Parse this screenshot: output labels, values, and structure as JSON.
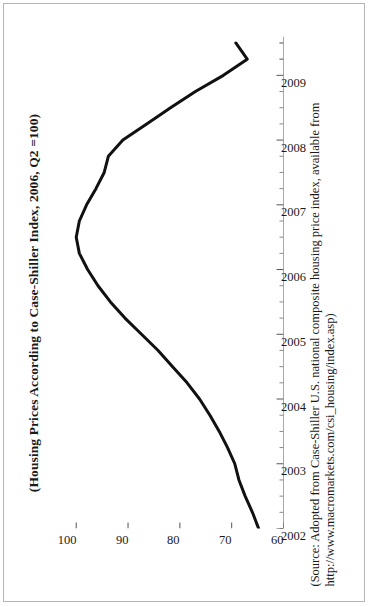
{
  "figure": {
    "title": "(Housing Prices According to Case-Shiller Index, 2006, Q2 =100)",
    "source_line_1": "(Source: Adopted from Case-Shiller U.S. national composite housing price index, available from",
    "source_line_2": "http://www.macromarkets.com/csi_housing/index.asp)"
  },
  "chart_data": {
    "type": "line",
    "title": "(Housing Prices According to Case-Shiller Index, 2006, Q2 =100)",
    "xlabel": "",
    "ylabel": "",
    "xlim": [
      2002,
      2009.6
    ],
    "ylim": [
      60,
      104
    ],
    "grid": false,
    "legend": null,
    "orientation": "page-rotated-90ccw",
    "xticks": [
      "2002",
      "2003",
      "2004",
      "2005",
      "2006",
      "2007",
      "2008",
      "2009"
    ],
    "xtick_values": [
      2002,
      2003,
      2004,
      2005,
      2006,
      2007,
      2008,
      2009
    ],
    "yticks": [
      "60",
      "70",
      "80",
      "90",
      "100"
    ],
    "ytick_values": [
      60,
      70,
      80,
      90,
      100
    ],
    "minor_xticks_per_interval": 4,
    "series": [
      {
        "name": "Case-Shiller U.S. national composite housing price index",
        "color": "#111111",
        "x": [
          2002.0,
          2002.25,
          2002.5,
          2002.75,
          2003.0,
          2003.25,
          2003.5,
          2003.75,
          2004.0,
          2004.25,
          2004.5,
          2004.75,
          2005.0,
          2005.25,
          2005.5,
          2005.75,
          2006.0,
          2006.25,
          2006.5,
          2006.75,
          2007.0,
          2007.25,
          2007.5,
          2007.75,
          2008.0,
          2008.25,
          2008.5,
          2008.75,
          2009.0,
          2009.25,
          2009.5
        ],
        "y": [
          64.8,
          66.0,
          67.4,
          68.6,
          69.4,
          70.8,
          72.4,
          74.2,
          76.2,
          78.6,
          81.4,
          84.2,
          87.4,
          90.6,
          93.4,
          95.8,
          97.8,
          99.4,
          100.0,
          99.4,
          98.0,
          96.2,
          94.6,
          93.8,
          91.0,
          86.4,
          81.8,
          77.0,
          71.6,
          67.0,
          69.2
        ],
        "annotations": [
          {
            "label": "peak",
            "x": 2006.5,
            "y": 100.0
          },
          {
            "label": "trough",
            "x": 2009.25,
            "y": 67.0
          }
        ]
      }
    ]
  }
}
